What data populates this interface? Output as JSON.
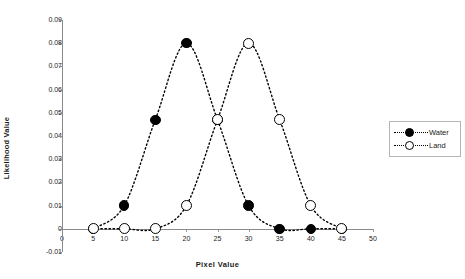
{
  "chart_data": {
    "type": "line",
    "title": "",
    "xlabel": "Pixel Value",
    "ylabel": "Likelihood Value",
    "xlim": [
      0,
      50
    ],
    "ylim": [
      -0.01,
      0.09
    ],
    "xticks": [
      0,
      5,
      10,
      15,
      20,
      25,
      30,
      35,
      40,
      45,
      50
    ],
    "yticks": [
      -0.01,
      0,
      0.01,
      0.02,
      0.03,
      0.04,
      0.05,
      0.06,
      0.07,
      0.08,
      0.09
    ],
    "ytick_labels": [
      "-0.01",
      "0",
      "0.01",
      "0.02",
      "0.03",
      "0.04",
      "0.05",
      "0.06",
      "0.07",
      "0.08",
      "0.09"
    ],
    "xtick_labels": [
      "0",
      "5",
      "10",
      "15",
      "20",
      "25",
      "30",
      "35",
      "40",
      "45",
      "50"
    ],
    "grid": false,
    "legend_position": "right",
    "linestyle": "dotted",
    "x": [
      5,
      10,
      15,
      20,
      25,
      30,
      35,
      40,
      45
    ],
    "series": [
      {
        "name": "Water",
        "marker": "filled-circle",
        "color": "#000000",
        "values": [
          0,
          0.01,
          0.047,
          0.08,
          0.047,
          0.01,
          0,
          0,
          0
        ]
      },
      {
        "name": "Land",
        "marker": "open-circle",
        "color": "#000000",
        "values": [
          0,
          0,
          0,
          0.01,
          0.047,
          0.08,
          0.047,
          0.01,
          0
        ]
      }
    ]
  },
  "legend": {
    "items": [
      {
        "label": "Water",
        "marker": "filled-circle"
      },
      {
        "label": "Land",
        "marker": "open-circle"
      }
    ]
  }
}
